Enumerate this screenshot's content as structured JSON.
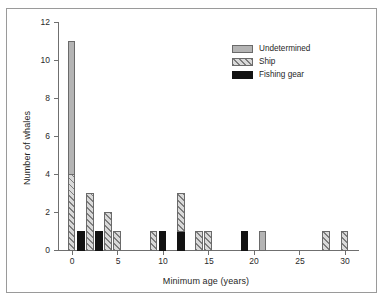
{
  "chart_data": {
    "type": "bar",
    "title": "",
    "subtitle": "",
    "xlabel": "Minimum age (years)",
    "ylabel": "Number of whales",
    "xlim": [
      -1.5,
      31.5
    ],
    "ylim": [
      0,
      12
    ],
    "xticks": [
      0,
      5,
      10,
      15,
      20,
      25,
      30
    ],
    "yticks": [
      0,
      2,
      4,
      6,
      8,
      10,
      12
    ],
    "grid": false,
    "stacked": true,
    "bar_width_years": 0.85,
    "legend": {
      "position": "top-right",
      "entries": [
        {
          "name": "Undetermined",
          "style": "solid-gray",
          "color": "#b4b4b4"
        },
        {
          "name": "Ship",
          "style": "diagonal-hatch",
          "color": "#d9d9d9"
        },
        {
          "name": "Fishing gear",
          "style": "solid-black",
          "color": "#121212"
        }
      ]
    },
    "categories": [
      0,
      1,
      2,
      3,
      4,
      5,
      9,
      10,
      12,
      14,
      15,
      19,
      21,
      28,
      30
    ],
    "series": [
      {
        "name": "Fishing gear",
        "color": "#121212",
        "style": "solid-black",
        "values": [
          0,
          1,
          0,
          1,
          0,
          0,
          0,
          1,
          1,
          0,
          0,
          1,
          0,
          0,
          0
        ]
      },
      {
        "name": "Ship",
        "color": "#d9d9d9",
        "style": "diagonal-hatch",
        "values": [
          4,
          0,
          3,
          0,
          2,
          1,
          1,
          0,
          2,
          1,
          1,
          0,
          0,
          1,
          1
        ]
      },
      {
        "name": "Undetermined",
        "color": "#b4b4b4",
        "style": "solid-gray",
        "values": [
          7,
          0,
          0,
          0,
          0,
          0,
          0,
          0,
          0,
          0,
          0,
          0,
          1,
          0,
          0
        ]
      }
    ],
    "totals": [
      11,
      1,
      3,
      1,
      2,
      1,
      1,
      1,
      3,
      1,
      1,
      1,
      1,
      1,
      1
    ],
    "bars": [
      {
        "x": 0,
        "total": 11,
        "segments": [
          {
            "series": "Ship",
            "from": 0,
            "to": 4
          },
          {
            "series": "Undetermined",
            "from": 4,
            "to": 11
          }
        ]
      },
      {
        "x": 1,
        "total": 1,
        "segments": [
          {
            "series": "Fishing gear",
            "from": 0,
            "to": 1
          }
        ]
      },
      {
        "x": 2,
        "total": 3,
        "segments": [
          {
            "series": "Ship",
            "from": 0,
            "to": 3
          }
        ]
      },
      {
        "x": 3,
        "total": 1,
        "segments": [
          {
            "series": "Fishing gear",
            "from": 0,
            "to": 1
          }
        ]
      },
      {
        "x": 4,
        "total": 2,
        "segments": [
          {
            "series": "Ship",
            "from": 0,
            "to": 2
          }
        ]
      },
      {
        "x": 5,
        "total": 1,
        "segments": [
          {
            "series": "Ship",
            "from": 0,
            "to": 1
          }
        ]
      },
      {
        "x": 9,
        "total": 1,
        "segments": [
          {
            "series": "Ship",
            "from": 0,
            "to": 1
          }
        ]
      },
      {
        "x": 10,
        "total": 1,
        "segments": [
          {
            "series": "Fishing gear",
            "from": 0,
            "to": 1
          }
        ]
      },
      {
        "x": 12,
        "total": 3,
        "segments": [
          {
            "series": "Fishing gear",
            "from": 0,
            "to": 1
          },
          {
            "series": "Ship",
            "from": 1,
            "to": 3
          }
        ]
      },
      {
        "x": 14,
        "total": 1,
        "segments": [
          {
            "series": "Ship",
            "from": 0,
            "to": 1
          }
        ]
      },
      {
        "x": 15,
        "total": 1,
        "segments": [
          {
            "series": "Ship",
            "from": 0,
            "to": 1
          }
        ]
      },
      {
        "x": 19,
        "total": 1,
        "segments": [
          {
            "series": "Fishing gear",
            "from": 0,
            "to": 1
          }
        ]
      },
      {
        "x": 21,
        "total": 1,
        "segments": [
          {
            "series": "Undetermined",
            "from": 0,
            "to": 1
          }
        ]
      },
      {
        "x": 28,
        "total": 1,
        "segments": [
          {
            "series": "Ship",
            "from": 0,
            "to": 1
          }
        ]
      },
      {
        "x": 30,
        "total": 1,
        "segments": [
          {
            "series": "Ship",
            "from": 0,
            "to": 1
          }
        ]
      }
    ]
  },
  "axis": {
    "ytick_labels": [
      "0",
      "2",
      "4",
      "6",
      "8",
      "10",
      "12"
    ],
    "xtick_labels": [
      "0",
      "5",
      "10",
      "15",
      "20",
      "25",
      "30"
    ]
  }
}
